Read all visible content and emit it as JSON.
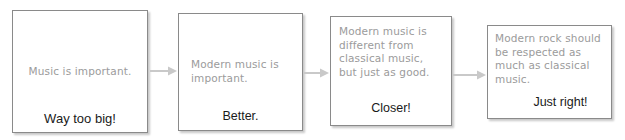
{
  "diagram": {
    "body_text_color": "#9b9b9b",
    "caption_text_color": "#1a1a1a",
    "box_border_color": "#8a8a8a",
    "arrow_color": "#c9c9c9",
    "background_color": "#ffffff",
    "steps": [
      {
        "id": "step-1",
        "body": "Music is important.",
        "caption": "Way too big!"
      },
      {
        "id": "step-2",
        "body": "Modern music is\nimportant.",
        "caption": "Better."
      },
      {
        "id": "step-3",
        "body": "Modern music is\ndifferent from\nclassical music,\nbut just as good.",
        "caption": "Closer!"
      },
      {
        "id": "step-4",
        "body": "Modern rock should\nbe respected as\nmuch as classical\nmusic.",
        "caption": "Just right!"
      }
    ],
    "connectors": [
      {
        "id": "arrow-1",
        "icon": "arrow-right-icon"
      },
      {
        "id": "arrow-2",
        "icon": "arrow-right-icon"
      },
      {
        "id": "arrow-3",
        "icon": "arrow-right-icon"
      }
    ]
  }
}
